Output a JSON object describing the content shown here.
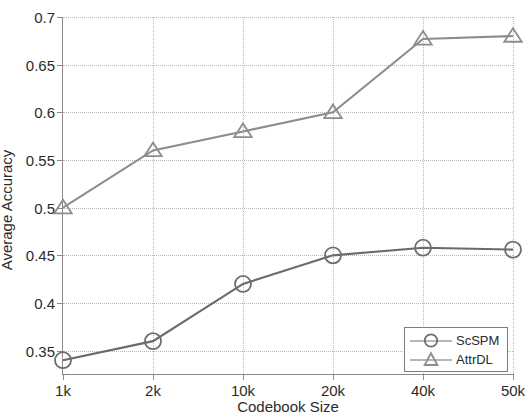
{
  "chart_data": {
    "type": "line",
    "title": "",
    "xlabel": "Codebook Size",
    "ylabel": "Average Accuracy",
    "categories": [
      "1k",
      "2k",
      "10k",
      "20k",
      "40k",
      "50k"
    ],
    "ytick_labels": [
      "0.35",
      "0.4",
      "0.45",
      "0.5",
      "0.55",
      "0.6",
      "0.65",
      "0.7"
    ],
    "ytick_values": [
      0.35,
      0.4,
      0.45,
      0.5,
      0.55,
      0.6,
      0.65,
      0.7
    ],
    "ylim": [
      0.3245,
      0.7
    ],
    "grid": true,
    "legend_position": "bottom-right",
    "series": [
      {
        "name": "ScSPM",
        "marker": "circle",
        "color": "#6a6a6a",
        "values": [
          0.34,
          0.36,
          0.42,
          0.45,
          0.458,
          0.456
        ]
      },
      {
        "name": "AttrDL",
        "marker": "triangle",
        "color": "#8d8d8d",
        "values": [
          0.5,
          0.56,
          0.58,
          0.6,
          0.677,
          0.68
        ]
      }
    ]
  },
  "legend": {
    "entries": [
      {
        "label": "ScSPM",
        "marker": "circle-marker-icon"
      },
      {
        "label": "AttrDL",
        "marker": "triangle-marker-icon"
      }
    ]
  },
  "colors": {
    "axis": "#8a8a8a",
    "grid": "#b9b9b9",
    "scspm": "#6a6a6a",
    "attrdl": "#8d8d8d",
    "text": "#2b2b2b",
    "background": "#ffffff"
  }
}
